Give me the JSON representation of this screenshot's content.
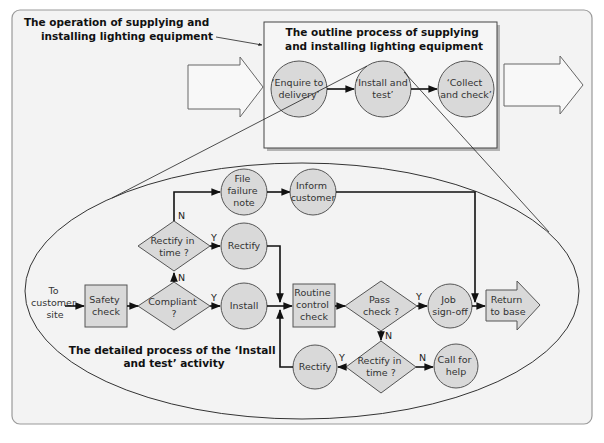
{
  "colors": {
    "frame_bg": "#f3f3f3",
    "frame_border": "#9a9a9a",
    "node_fill": "#d9d9d9",
    "node_stroke": "#555555",
    "line": "#111111"
  },
  "labels": {
    "operation_title": [
      "The operation of supplying and",
      "installing lighting equipment"
    ],
    "outline_title": [
      "The outline process of supplying",
      "and installing lighting equipment"
    ],
    "detailed_title": [
      "The detailed process of the ‘Install",
      "and test’ activity"
    ]
  },
  "outline": {
    "nodes": [
      {
        "id": "enquire",
        "lines": [
          "‘Enquire to",
          "delivery’"
        ]
      },
      {
        "id": "install_test",
        "lines": [
          "‘Install and",
          "test’"
        ]
      },
      {
        "id": "collect",
        "lines": [
          "‘Collect",
          "and check’"
        ]
      }
    ]
  },
  "detailed": {
    "start": [
      "To",
      "customer",
      "site"
    ],
    "safety_check": [
      "Safety",
      "check"
    ],
    "compliant": [
      "Compliant",
      "?"
    ],
    "install": [
      "Install"
    ],
    "rectify_in_time_top": [
      "Rectify in",
      "time ?"
    ],
    "rectify_top": [
      "Rectify"
    ],
    "file_failure": [
      "File",
      "failure",
      "note"
    ],
    "inform_customer": [
      "Inform",
      "customer"
    ],
    "routine_check": [
      "Routine",
      "control",
      "check"
    ],
    "pass_check": [
      "Pass",
      "check ?"
    ],
    "job_signoff": [
      "Job",
      "sign-off"
    ],
    "return_base": [
      "Return",
      "to base"
    ],
    "rectify_in_time_bottom": [
      "Rectify in",
      "time ?"
    ],
    "rectify_bottom": [
      "Rectify"
    ],
    "call_help": [
      "Call for",
      "help"
    ],
    "yes": "Y",
    "no": "N"
  }
}
